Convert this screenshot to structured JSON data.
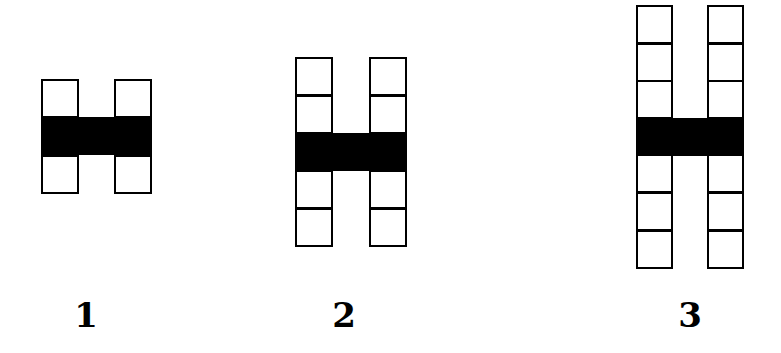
{
  "diagram": {
    "title": "",
    "figures": [
      {
        "label": "1",
        "squares_above": 1,
        "squares_below": 1,
        "left_x": 41,
        "right_x": 114,
        "top_y": 79,
        "unit": 38.4,
        "col_w": 38
      },
      {
        "label": "2",
        "squares_above": 2,
        "squares_below": 2,
        "left_x": 295,
        "right_x": 369,
        "top_y": 57,
        "unit": 38,
        "col_w": 38
      },
      {
        "label": "3",
        "squares_above": 3,
        "squares_below": 3,
        "left_x": 636,
        "right_x": 707,
        "top_y": 5,
        "unit": 37.6,
        "col_w": 37
      }
    ],
    "labels": {
      "fig1": "1",
      "fig2": "2",
      "fig3": "3"
    },
    "colors": {
      "stroke": "#000000",
      "bar": "#000000",
      "background": "#ffffff"
    }
  }
}
